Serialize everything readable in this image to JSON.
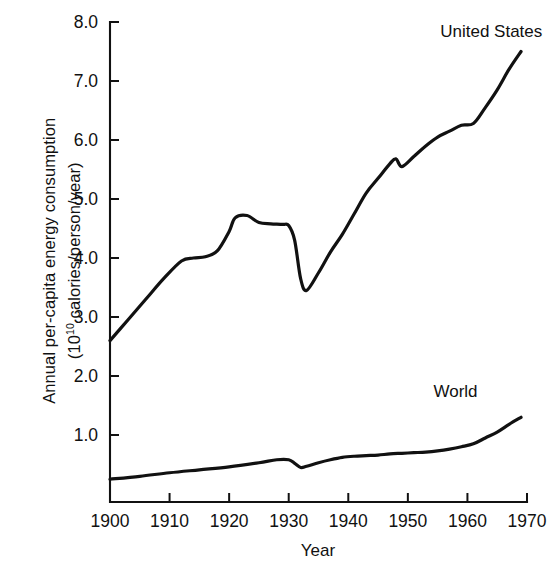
{
  "chart_data": {
    "type": "line",
    "title": "",
    "xlabel": "Year",
    "ylabel": "Annual per-capita energy consumption (10^10 calories/person/year)",
    "ylabel_line1": "Annual per-capita energy consumption",
    "ylabel_line2_pre": "(10",
    "ylabel_line2_sup": "10",
    "ylabel_line2_post": " calories/person/year)",
    "xlim": [
      1900,
      1970
    ],
    "ylim": [
      0,
      8.0
    ],
    "grid": false,
    "legend_position": "inline-annotation",
    "xticks": [
      1900,
      1910,
      1920,
      1930,
      1940,
      1950,
      1960,
      1970
    ],
    "xtick_labels": [
      "1900",
      "1910",
      "1920",
      "1930",
      "1940",
      "1950",
      "1960",
      "1970"
    ],
    "yticks": [
      1.0,
      2.0,
      3.0,
      4.0,
      5.0,
      6.0,
      7.0,
      8.0
    ],
    "ytick_labels": [
      "1.0",
      "2.0",
      "3.0",
      "4.0",
      "5.0",
      "6.0",
      "7.0",
      "8.0"
    ],
    "series": [
      {
        "name": "United States",
        "label": "United States",
        "color": "#111111",
        "x": [
          1900,
          1903,
          1906,
          1909,
          1912,
          1914,
          1916,
          1918,
          1920,
          1921,
          1923,
          1925,
          1927,
          1929,
          1930,
          1931,
          1932,
          1933,
          1935,
          1937,
          1939,
          1941,
          1943,
          1945,
          1947,
          1948,
          1949,
          1951,
          1953,
          1955,
          1957,
          1959,
          1961,
          1963,
          1965,
          1967,
          1969
        ],
        "values": [
          2.6,
          2.95,
          3.3,
          3.65,
          3.95,
          4.0,
          4.02,
          4.12,
          4.45,
          4.68,
          4.72,
          4.6,
          4.58,
          4.57,
          4.55,
          4.3,
          3.65,
          3.45,
          3.75,
          4.1,
          4.4,
          4.75,
          5.1,
          5.35,
          5.6,
          5.68,
          5.55,
          5.72,
          5.9,
          6.05,
          6.15,
          6.25,
          6.28,
          6.55,
          6.85,
          7.2,
          7.5
        ]
      },
      {
        "name": "World",
        "label": "World",
        "color": "#111111",
        "x": [
          1900,
          1905,
          1910,
          1915,
          1920,
          1925,
          1928,
          1930,
          1931,
          1932,
          1933,
          1935,
          1937,
          1939,
          1941,
          1943,
          1945,
          1947,
          1949,
          1951,
          1953,
          1955,
          1957,
          1959,
          1961,
          1963,
          1965,
          1967,
          1969
        ],
        "values": [
          0.25,
          0.3,
          0.36,
          0.41,
          0.46,
          0.53,
          0.58,
          0.58,
          0.52,
          0.45,
          0.47,
          0.53,
          0.58,
          0.62,
          0.64,
          0.65,
          0.66,
          0.68,
          0.69,
          0.7,
          0.71,
          0.73,
          0.76,
          0.8,
          0.85,
          0.95,
          1.05,
          1.18,
          1.3
        ]
      }
    ],
    "annotations": [
      {
        "text": "United States",
        "x": 1964,
        "y": 7.75
      },
      {
        "text": "World",
        "x": 1958,
        "y": 1.65
      }
    ]
  }
}
